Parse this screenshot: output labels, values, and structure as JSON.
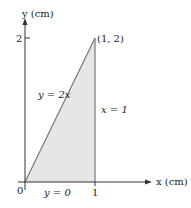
{
  "axes": {
    "x_label": "x (cm)",
    "y_label": "y (cm)",
    "origin_label": "0",
    "x_tick_label": "1",
    "y_tick_label": "2"
  },
  "region": {
    "vertex_label": "(1, 2)",
    "fill_color": "#e6e6e6",
    "edge_color": "#777777"
  },
  "curves": {
    "diagonal": "y = 2x",
    "vertical": "x = 1",
    "bottom": "y = 0"
  }
}
